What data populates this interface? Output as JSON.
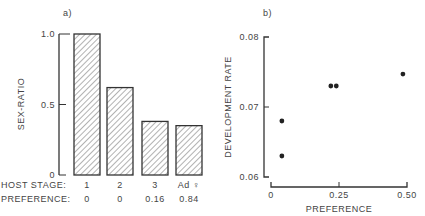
{
  "chart_data": [
    {
      "type": "bar",
      "panel_label": "a)",
      "title": "",
      "xlabel": "HOST STAGE:",
      "ylabel": "SEX-RATIO",
      "ylim": [
        0,
        1.0
      ],
      "yticks": [
        "0",
        "0.5",
        "1.0"
      ],
      "categories": [
        "1",
        "2",
        "3",
        "Ad ♀"
      ],
      "values": [
        1.0,
        0.62,
        0.38,
        0.35
      ],
      "secondary_row_label": "PREFERENCE:",
      "secondary_row_values": [
        "0",
        "0",
        "0.16",
        "0.84"
      ],
      "bar_fill": "hatched",
      "grid": false
    },
    {
      "type": "scatter",
      "panel_label": "b)",
      "title": "",
      "xlabel": "PREFERENCE",
      "ylabel": "DEVELOPMENT RATE",
      "xlim": [
        0,
        0.5
      ],
      "ylim": [
        0.06,
        0.08
      ],
      "xticks": [
        "0",
        "0.25",
        "0.50"
      ],
      "yticks": [
        "0.06",
        "0.07",
        "0.08"
      ],
      "points": [
        {
          "x": 0.04,
          "y": 0.068
        },
        {
          "x": 0.04,
          "y": 0.063
        },
        {
          "x": 0.22,
          "y": 0.073
        },
        {
          "x": 0.24,
          "y": 0.073
        },
        {
          "x": 0.485,
          "y": 0.0747
        }
      ],
      "grid": false
    }
  ]
}
